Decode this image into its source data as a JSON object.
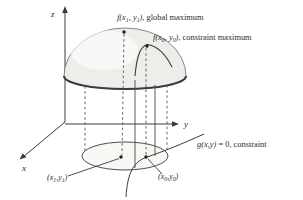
{
  "diagram": {
    "colors": {
      "ink": "#3a3a3a",
      "dome_fill": "#ededea",
      "dome_rim": "#3c3c3c",
      "base_fill": "#f7f7f4",
      "background": "#ffffff"
    },
    "axes": {
      "x": "x",
      "y": "y",
      "z": "z"
    },
    "labels": {
      "global_max": {
        "m1": "f(x",
        "s1": "1",
        "m2": ", y",
        "s2": "1",
        "m3": ")",
        "rest": ", global maximum"
      },
      "constraint_max": {
        "m1": "f(x",
        "s1": "0",
        "m2": ", y",
        "s2": "0",
        "m3": ")",
        "rest": ", constraint maximum"
      },
      "constraint_eq": {
        "m1": "g(x,y)",
        "m2": " = 0,",
        "rest": " constraint"
      },
      "point1": {
        "m1": "(x",
        "s1": "1",
        "m2": ",y",
        "s2": "1",
        "m3": ")"
      },
      "point0": {
        "m1": "(x",
        "s1": "0",
        "m2": ",y",
        "s2": "0",
        "m3": ")"
      }
    },
    "points": {
      "global_maximum_marker": "dot at top of dome",
      "constraint_maximum_marker": "dot on section arc of dome",
      "base_point_x1y1": "dot at center of base circle",
      "base_point_x0y0": "dot on constraint curve in base plane"
    }
  }
}
